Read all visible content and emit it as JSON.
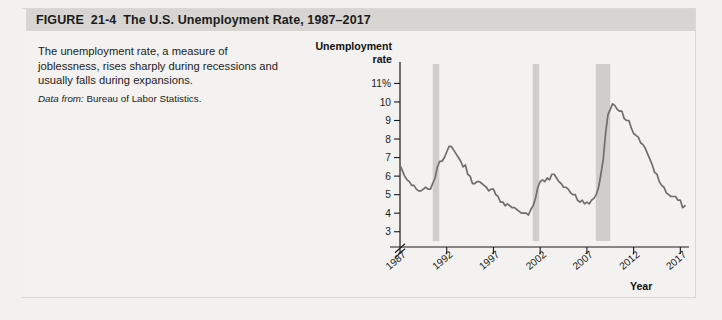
{
  "figure": {
    "number_label": "FIGURE",
    "number": "21-4",
    "title": "The U.S. Unemployment Rate, 1987–2017",
    "caption": "The unemployment rate, a measure of joblessness, rises sharply during recessions and usually falls during expansions.",
    "source_prefix": "Data from:",
    "source": "Bureau of Labor Statistics."
  },
  "colors": {
    "header_bar": "#d6d5d2",
    "page_bg": "#f2f1ef",
    "line": "#6e6e6e",
    "recession_band": "#cfcecb",
    "axis": "#1a1a1a"
  },
  "chart_data": {
    "type": "line",
    "title": "The U.S. Unemployment Rate, 1987–2017",
    "xlabel": "Year",
    "ylabel": "Unemployment rate",
    "ylabel_line1": "Unemployment",
    "ylabel_line2": "rate",
    "grid": false,
    "legend": "none",
    "axis_break_y": true,
    "ylim": [
      2.5,
      11.4
    ],
    "xlim": [
      1987,
      2017.5
    ],
    "ytick_labels": [
      "11%",
      "10",
      "9",
      "8",
      "7",
      "6",
      "5",
      "4",
      "3"
    ],
    "yticks": [
      11,
      10,
      9,
      8,
      7,
      6,
      5,
      4,
      3
    ],
    "xtick_labels": [
      "1987",
      "1992",
      "1997",
      "2002",
      "2007",
      "2012",
      "2017"
    ],
    "xticks": [
      1987,
      1992,
      1997,
      2002,
      2007,
      2012,
      2017
    ],
    "recession_bands": [
      {
        "start": 1990.5,
        "end": 1991.2,
        "label": "1990-91 recession"
      },
      {
        "start": 2001.2,
        "end": 2001.9,
        "label": "2001 recession"
      },
      {
        "start": 2007.95,
        "end": 2009.5,
        "label": "2007-09 recession"
      }
    ],
    "series": [
      {
        "name": "Unemployment rate",
        "color": "#6e6e6e",
        "x": [
          1987.0,
          1987.25,
          1987.5,
          1987.75,
          1988.0,
          1988.25,
          1988.5,
          1988.75,
          1989.0,
          1989.25,
          1989.5,
          1989.75,
          1990.0,
          1990.25,
          1990.5,
          1990.75,
          1991.0,
          1991.25,
          1991.5,
          1991.75,
          1992.0,
          1992.25,
          1992.5,
          1992.75,
          1993.0,
          1993.25,
          1993.5,
          1993.75,
          1994.0,
          1994.25,
          1994.5,
          1994.75,
          1995.0,
          1995.25,
          1995.5,
          1995.75,
          1996.0,
          1996.25,
          1996.5,
          1996.75,
          1997.0,
          1997.25,
          1997.5,
          1997.75,
          1998.0,
          1998.25,
          1998.5,
          1998.75,
          1999.0,
          1999.25,
          1999.5,
          1999.75,
          2000.0,
          2000.25,
          2000.5,
          2000.75,
          2001.0,
          2001.25,
          2001.5,
          2001.75,
          2002.0,
          2002.25,
          2002.5,
          2002.75,
          2003.0,
          2003.25,
          2003.5,
          2003.75,
          2004.0,
          2004.25,
          2004.5,
          2004.75,
          2005.0,
          2005.25,
          2005.5,
          2005.75,
          2006.0,
          2006.25,
          2006.5,
          2006.75,
          2007.0,
          2007.25,
          2007.5,
          2007.75,
          2008.0,
          2008.25,
          2008.5,
          2008.75,
          2009.0,
          2009.25,
          2009.5,
          2009.75,
          2010.0,
          2010.25,
          2010.5,
          2010.75,
          2011.0,
          2011.25,
          2011.5,
          2011.75,
          2012.0,
          2012.25,
          2012.5,
          2012.75,
          2013.0,
          2013.25,
          2013.5,
          2013.75,
          2014.0,
          2014.25,
          2014.5,
          2014.75,
          2015.0,
          2015.25,
          2015.5,
          2015.75,
          2016.0,
          2016.25,
          2016.5,
          2016.75,
          2017.0,
          2017.25,
          2017.5
        ],
        "y": [
          6.6,
          6.3,
          6.0,
          5.8,
          5.7,
          5.5,
          5.5,
          5.3,
          5.2,
          5.2,
          5.3,
          5.4,
          5.3,
          5.3,
          5.6,
          5.9,
          6.5,
          6.8,
          6.8,
          7.0,
          7.3,
          7.6,
          7.6,
          7.4,
          7.2,
          7.0,
          6.8,
          6.5,
          6.6,
          6.1,
          6.0,
          5.6,
          5.6,
          5.7,
          5.7,
          5.6,
          5.5,
          5.4,
          5.2,
          5.3,
          5.3,
          5.0,
          4.9,
          4.6,
          4.6,
          4.4,
          4.5,
          4.4,
          4.3,
          4.3,
          4.2,
          4.1,
          4.0,
          4.0,
          4.0,
          3.9,
          4.2,
          4.4,
          4.8,
          5.4,
          5.7,
          5.8,
          5.7,
          5.9,
          5.8,
          6.1,
          6.1,
          5.9,
          5.7,
          5.6,
          5.4,
          5.4,
          5.3,
          5.1,
          5.0,
          5.0,
          4.7,
          4.6,
          4.7,
          4.5,
          4.6,
          4.5,
          4.7,
          4.8,
          5.0,
          5.4,
          6.1,
          6.9,
          8.3,
          9.3,
          9.6,
          9.9,
          9.8,
          9.6,
          9.5,
          9.5,
          9.1,
          9.0,
          9.0,
          8.6,
          8.3,
          8.2,
          8.1,
          7.8,
          7.7,
          7.5,
          7.2,
          6.9,
          6.6,
          6.2,
          6.1,
          5.7,
          5.5,
          5.4,
          5.1,
          5.0,
          4.9,
          4.9,
          4.9,
          4.7,
          4.7,
          4.3,
          4.4
        ]
      }
    ]
  }
}
